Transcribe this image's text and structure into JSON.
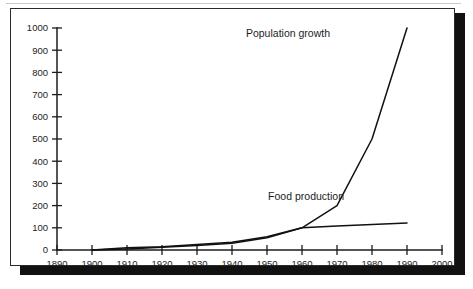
{
  "figure": {
    "background_color": "#ffffff",
    "panel_border_color": "#2b2b2b",
    "shadow_color": "#111111",
    "line_color": "#111111"
  },
  "chart_data": {
    "type": "line",
    "title": "",
    "subtitle": "",
    "xlabel": "",
    "ylabel": "",
    "xlim": [
      1890,
      2000
    ],
    "ylim": [
      0,
      1000
    ],
    "grid": false,
    "legend_position": "inline-annotations",
    "x_ticks": [
      1890,
      1900,
      1910,
      1920,
      1930,
      1940,
      1950,
      1960,
      1970,
      1980,
      1990,
      2000
    ],
    "x_tick_labels": [
      "1890",
      "1900",
      "1910",
      "1920",
      "1930",
      "1940",
      "1950",
      "1960",
      "1970",
      "1980",
      "1990",
      "2000"
    ],
    "y_ticks": [
      0,
      100,
      200,
      300,
      400,
      500,
      600,
      700,
      800,
      900,
      1000
    ],
    "y_tick_labels": [
      "0",
      "100",
      "200",
      "300",
      "400",
      "500",
      "600",
      "700",
      "800",
      "900",
      "1000"
    ],
    "series": [
      {
        "name": "Population growth",
        "label": "Population growth",
        "x": [
          1900,
          1910,
          1920,
          1930,
          1940,
          1950,
          1960,
          1970,
          1980,
          1990
        ],
        "values": [
          0,
          5,
          12,
          20,
          30,
          55,
          100,
          200,
          500,
          1000
        ]
      },
      {
        "name": "Food production",
        "label": "Food production",
        "x": [
          1900,
          1910,
          1920,
          1930,
          1940,
          1950,
          1960,
          1970,
          1980,
          1990
        ],
        "values": [
          0,
          10,
          15,
          25,
          35,
          60,
          100,
          108,
          115,
          122
        ]
      }
    ],
    "annotations": [
      {
        "text": "Population growth",
        "x": 1968,
        "y": 960
      },
      {
        "text": "Food production",
        "x": 1972,
        "y": 225
      }
    ]
  }
}
